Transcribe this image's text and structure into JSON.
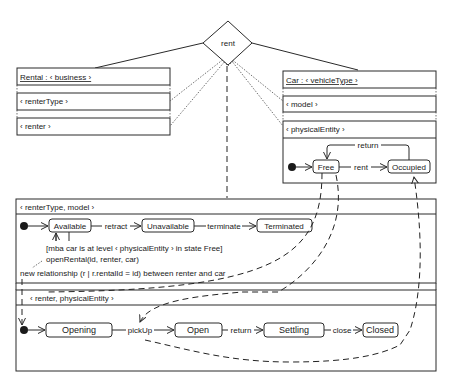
{
  "relationship": {
    "label": "rent"
  },
  "rental": {
    "title": "Rental : ‹ business ›",
    "levels": [
      "‹ renterType ›",
      "‹ renter ›"
    ]
  },
  "car": {
    "title": "Car : ‹ vehicleType ›",
    "levels": [
      "‹ model ›",
      "‹ physicalEntity ›"
    ],
    "states": [
      "Free",
      "Occupied"
    ],
    "transitions": {
      "rent": "rent",
      "return": "return"
    }
  },
  "lower": {
    "level1": {
      "header": "‹ renterType, model ›",
      "states": [
        "Available",
        "Unavailable",
        "Terminated"
      ],
      "transitions": {
        "retract": "retract",
        "terminate": "terminate"
      },
      "guard": "[mba car is at level ‹ physicalEntity › in state Free]",
      "action": "openRental(id, renter, car)",
      "effect": "new relationship (r | r.rentalId = id) between renter and car"
    },
    "level2": {
      "header": "‹ renter, physicalEntity ›",
      "states": [
        "Opening",
        "Open",
        "Settling",
        "Closed"
      ],
      "transitions": {
        "pickUp": "pickUp",
        "return": "return",
        "close": "close"
      }
    }
  }
}
